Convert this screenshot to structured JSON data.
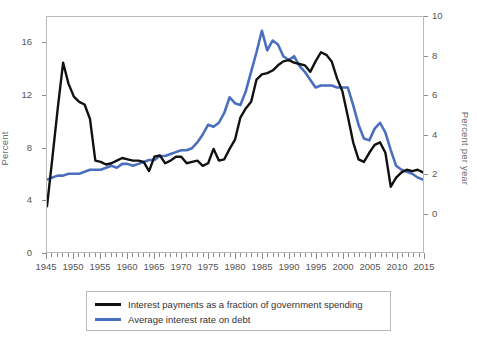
{
  "chart_data": {
    "type": "line",
    "title": "",
    "subtitle": "",
    "xlabel": "",
    "ylabel": "Percent",
    "ylabel_right": "Percent per year",
    "xlim": [
      1945,
      2015
    ],
    "ylim": [
      0,
      18
    ],
    "ylim_right": [
      -2,
      10
    ],
    "grid": false,
    "legend_position": "bottom",
    "xticks": [
      1945,
      1950,
      1955,
      1960,
      1965,
      1970,
      1975,
      1980,
      1985,
      1990,
      1995,
      2000,
      2005,
      2010,
      2015
    ],
    "xticks_minor_step": 1,
    "yticks_left": [
      0,
      4,
      8,
      12,
      16
    ],
    "yticks_right": [
      0,
      2,
      4,
      6,
      8,
      10
    ],
    "colors": {
      "black_series": "#111111",
      "blue_series": "#4a6fbf",
      "frame": "#b9b9b9",
      "text": "#555555"
    },
    "x": [
      1945,
      1946,
      1947,
      1948,
      1949,
      1950,
      1951,
      1952,
      1953,
      1954,
      1955,
      1956,
      1957,
      1958,
      1959,
      1960,
      1961,
      1962,
      1963,
      1964,
      1965,
      1966,
      1967,
      1968,
      1969,
      1970,
      1971,
      1972,
      1973,
      1974,
      1975,
      1976,
      1977,
      1978,
      1979,
      1980,
      1981,
      1982,
      1983,
      1984,
      1985,
      1986,
      1987,
      1988,
      1989,
      1990,
      1991,
      1992,
      1993,
      1994,
      1995,
      1996,
      1997,
      1998,
      1999,
      2000,
      2001,
      2002,
      2003,
      2004,
      2005,
      2006,
      2007,
      2008,
      2009,
      2010,
      2011,
      2012,
      2013,
      2014,
      2015
    ],
    "series": [
      {
        "name": "Interest payments as a fraction of government spending",
        "axis": "left",
        "color": "#111111",
        "unit": "Percent",
        "values": [
          3.5,
          7.2,
          11.0,
          14.5,
          12.9,
          11.9,
          11.5,
          11.3,
          10.2,
          7.0,
          6.9,
          6.7,
          6.8,
          7.0,
          7.2,
          7.1,
          7.0,
          7.0,
          6.9,
          6.2,
          7.3,
          7.4,
          6.8,
          7.0,
          7.3,
          7.3,
          6.8,
          6.9,
          7.0,
          6.6,
          6.8,
          7.9,
          7.0,
          7.1,
          7.9,
          8.6,
          10.3,
          11.0,
          11.5,
          13.2,
          13.6,
          13.7,
          13.9,
          14.3,
          14.6,
          14.7,
          14.5,
          14.4,
          14.3,
          13.8,
          14.6,
          15.3,
          15.1,
          14.6,
          13.3,
          12.3,
          10.4,
          8.4,
          7.1,
          6.9,
          7.6,
          8.2,
          8.4,
          7.6,
          5.0,
          5.7,
          6.1,
          6.3,
          6.2,
          6.3,
          6.1
        ]
      },
      {
        "name": "Average interest rate on debt",
        "axis": "right",
        "color": "#4a6fbf",
        "unit": "Percent per year",
        "values": [
          1.7,
          1.8,
          1.9,
          1.9,
          2.0,
          2.0,
          2.0,
          2.1,
          2.2,
          2.2,
          2.2,
          2.3,
          2.4,
          2.3,
          2.5,
          2.5,
          2.4,
          2.5,
          2.6,
          2.7,
          2.7,
          2.9,
          2.9,
          3.0,
          3.1,
          3.2,
          3.2,
          3.3,
          3.6,
          4.0,
          4.5,
          4.4,
          4.6,
          5.1,
          5.9,
          5.6,
          5.5,
          6.2,
          7.2,
          8.2,
          9.3,
          8.3,
          8.8,
          8.6,
          8.0,
          7.8,
          8.0,
          7.5,
          7.2,
          6.8,
          6.4,
          6.5,
          6.5,
          6.5,
          6.4,
          6.4,
          6.4,
          5.5,
          4.5,
          3.8,
          3.7,
          4.3,
          4.6,
          4.1,
          3.2,
          2.4,
          2.2,
          2.1,
          2.0,
          1.8,
          1.7
        ]
      }
    ]
  },
  "legend": {
    "items": [
      {
        "label": "Interest payments as a fraction of government spending",
        "color": "#111111"
      },
      {
        "label": "Average interest rate on debt",
        "color": "#4a6fbf"
      }
    ]
  }
}
